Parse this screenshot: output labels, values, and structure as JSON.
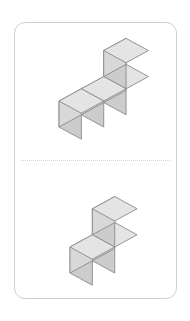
{
  "page": {
    "background_color": "#ffffff",
    "width": 190,
    "height": 321
  },
  "card": {
    "name": "isometric-cube-figures-card",
    "background_color": "#ffffff",
    "border_color": "#cfcfcf",
    "corner_radius": 11
  },
  "divider": {
    "style": "dotted",
    "color": "#d2d2d2"
  },
  "cube_style": {
    "top_face_color": "#e4e4e4",
    "left_face_color": "#cccccc",
    "right_face_color": "#d8d8d8",
    "edge_color": "#8a8a8a",
    "edge_width": 0.9
  },
  "figures": [
    {
      "name": "figure-top",
      "label": "top-cube-figure",
      "cube_count": 4,
      "description": "row of three cubes receding to the upper right with a fourth cube stacked on top of the rightmost cube",
      "cube_size": 26,
      "origin_x": 44,
      "origin_y": 104,
      "cubes": [
        {
          "col": 0,
          "row": 0,
          "level": 0
        },
        {
          "col": 1,
          "row": 0,
          "level": 0
        },
        {
          "col": 2,
          "row": 0,
          "level": 0
        },
        {
          "col": 2,
          "row": 0,
          "level": 1
        }
      ]
    },
    {
      "name": "figure-bottom",
      "label": "bottom-cube-figure",
      "cube_count": 3,
      "description": "row of two cubes receding to the upper right with a third cube stacked on top of the rightmost cube",
      "cube_size": 26,
      "origin_x": 55,
      "origin_y": 112,
      "cubes": [
        {
          "col": 0,
          "row": 0,
          "level": 0
        },
        {
          "col": 1,
          "row": 0,
          "level": 0
        },
        {
          "col": 1,
          "row": 0,
          "level": 1
        }
      ]
    }
  ]
}
